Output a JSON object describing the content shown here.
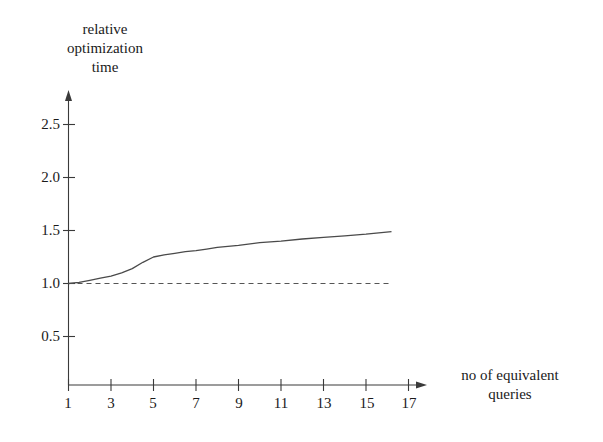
{
  "chart_data": {
    "type": "line",
    "title": "",
    "ylabel": "relative optimization time",
    "ylabel_lines": [
      "relative",
      "optimization",
      "time"
    ],
    "xlabel": "no of equivalent queries",
    "xlabel_lines": [
      "no of equivalent",
      "queries"
    ],
    "xlim": [
      0,
      18
    ],
    "ylim": [
      0,
      2.8
    ],
    "xticks": [
      1,
      3,
      5,
      7,
      9,
      11,
      13,
      15,
      17
    ],
    "xtick_labels": [
      "1",
      "3",
      "5",
      "7",
      "9",
      "11",
      "13",
      "15",
      "17"
    ],
    "yticks": [
      0.5,
      1.0,
      1.5,
      2.0,
      2.5
    ],
    "ytick_labels": [
      "0.5",
      "1.0",
      "1.5",
      "2.0",
      "2.5"
    ],
    "grid": false,
    "legend": "none",
    "axis_arrows": {
      "x": true,
      "y": true
    },
    "series": [
      {
        "name": "relative optimization time",
        "style": "solid",
        "color": "#4a4a4a",
        "x": [
          1,
          1.5,
          2,
          2.5,
          3,
          3.5,
          4,
          4.5,
          5,
          5.5,
          6,
          6.5,
          7,
          7.5,
          8,
          9,
          10,
          11,
          12,
          13,
          14,
          15,
          16.2
        ],
        "y": [
          1.0,
          1.01,
          1.03,
          1.05,
          1.07,
          1.1,
          1.14,
          1.2,
          1.25,
          1.27,
          1.285,
          1.3,
          1.31,
          1.325,
          1.34,
          1.36,
          1.385,
          1.4,
          1.42,
          1.435,
          1.45,
          1.465,
          1.49
        ]
      },
      {
        "name": "baseline",
        "style": "dashed",
        "color": "#555555",
        "x": [
          1,
          16.2
        ],
        "y": [
          1.0,
          1.0
        ]
      }
    ]
  },
  "colors": {
    "background": "#ffffff",
    "axis": "#3a3a3a",
    "curve": "#4a4a4a",
    "baseline": "#555555",
    "text": "#1a1a1a"
  }
}
